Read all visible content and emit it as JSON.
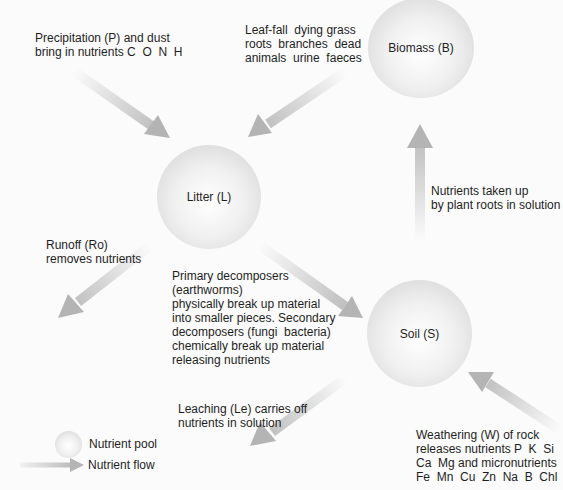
{
  "diagram": {
    "pools": {
      "biomass": "Biomass (B)",
      "litter": "Litter (L)",
      "soil": "Soil (S)"
    },
    "flows": {
      "precipitation": "Precipitation (P) and dust\nbring in nutrients C  O  N  H",
      "litterfall": "Leaf-fall  dying grass\nroots  branches  dead\nanimals  urine  faeces",
      "uptake": "Nutrients taken up\nby plant roots in solution",
      "runoff": "Runoff (Ro)\nremoves nutrients",
      "decomposition": "Primary decomposers\n(earthworms)\nphysically break up material\ninto smaller pieces. Secondary\ndecomposers (fungi  bacteria)\nchemically break up material\nreleasing nutrients",
      "leaching": "Leaching (Le) carries off\nnutrients in solution",
      "weathering": "Weathering (W) of rock\nreleases nutrients P  K  Si\nCa  Mg and micronutrients\nFe  Mn  Cu  Zn  Na  B  Chl"
    },
    "legend": {
      "pool": "Nutrient pool",
      "flow": "Nutrient flow"
    },
    "colors": {
      "arrow": "#b4b4b4",
      "background": "#fbfbfb",
      "text": "#1e1e1e"
    }
  }
}
